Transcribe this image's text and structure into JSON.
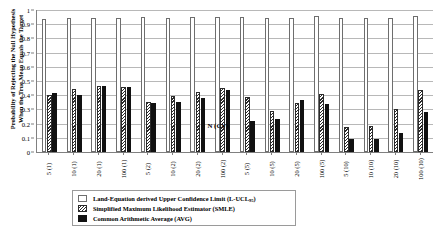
{
  "chart_data": {
    "type": "bar",
    "title": "",
    "xlabel": "N (CV)",
    "ylabel_line1": "Probability of Rejecting the Null Hypothesis",
    "ylabel_line2": "When the True Mean Equals the Target",
    "ylim": [
      0,
      1
    ],
    "ytick_labels": [
      "0",
      "0.1",
      "0.2",
      "0.3",
      "0.4",
      "0.5",
      "0.6",
      "0.7",
      "0.8",
      "0.9",
      "1"
    ],
    "ytick_values": [
      0,
      0.1,
      0.2,
      0.3,
      0.4,
      0.5,
      0.6,
      0.7,
      0.8,
      0.9,
      1
    ],
    "grid": true,
    "legend_position": "bottom",
    "categories": [
      "5 (1)",
      "10 (1)",
      "20 (1)",
      "100 (1)",
      "5 (2)",
      "10 (2)",
      "20 (2)",
      "100 (2)",
      "5 (5)",
      "10 (5)",
      "20 (5)",
      "100 (5)",
      "5 (10)",
      "10 (10)",
      "20 (10)",
      "100 (10)"
    ],
    "series": [
      {
        "name": "Land-Equation derived Upper Confidence Limit (L-UCL95)",
        "key": "lucl",
        "values": [
          0.94,
          0.945,
          0.945,
          0.945,
          0.95,
          0.945,
          0.95,
          0.95,
          0.95,
          0.945,
          0.945,
          0.96,
          0.945,
          0.945,
          0.945,
          0.955
        ]
      },
      {
        "name": "Simplified Maximum Likelihood Estimator (SMLE)",
        "key": "smle",
        "values": [
          0.4,
          0.445,
          0.465,
          0.46,
          0.355,
          0.395,
          0.425,
          0.45,
          0.385,
          0.29,
          0.345,
          0.41,
          0.175,
          0.185,
          0.3,
          0.44
        ]
      },
      {
        "name": "Common Arithmetic Average (AVG)",
        "key": "avg",
        "values": [
          0.415,
          0.405,
          0.465,
          0.46,
          0.345,
          0.355,
          0.38,
          0.435,
          0.215,
          0.235,
          0.365,
          0.335,
          0.095,
          0.095,
          0.135,
          0.285
        ]
      }
    ]
  },
  "legend": {
    "items": [
      {
        "label_main": "Land-Equation derived Upper Confidence Limit (L-UCL",
        "label_sub": "95",
        "label_tail": ")",
        "key": "lucl"
      },
      {
        "label_main": "Simplified Maximum Likelihood Estimator (SMLE)",
        "label_sub": "",
        "label_tail": "",
        "key": "smle"
      },
      {
        "label_main": "Common Arithmetic Average  (AVG)",
        "label_sub": "",
        "label_tail": "",
        "key": "avg"
      }
    ]
  }
}
